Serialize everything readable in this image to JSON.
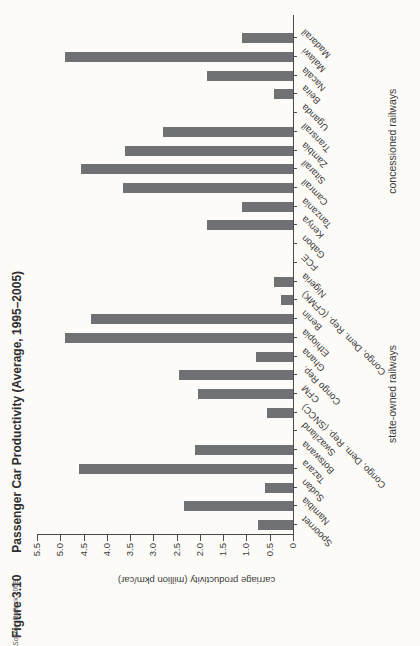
{
  "figure": {
    "label": "Figure 3.10",
    "title": "Passenger Car Productivity (Average, 1995–2005)"
  },
  "source": {
    "prefix": "Source:",
    "text": "Bullock 2009."
  },
  "chart_data": {
    "type": "bar",
    "title": "Passenger Car Productivity (Average, 1995–2005)",
    "figure_label": "Figure 3.10",
    "ylabel": "carriage productivity (million pkm/car)",
    "xlabel": "",
    "ylim": [
      0,
      5.5
    ],
    "ytick_labels": [
      "0",
      "0.5",
      "1.0",
      "1.5",
      "2.0",
      "2.5",
      "3.0",
      "3.5",
      "4.0",
      "4.5",
      "5.0",
      "5.5"
    ],
    "grid": false,
    "legend": false,
    "bar_color": "#707174",
    "layout_note": "figure printed rotated 90deg counterclockwise on portrait page; category labels angled 45deg; missing bars mean no data",
    "groups": [
      {
        "label": "state-owned railways",
        "categories": [
          "Spoornet",
          "Namibia",
          "Sudan",
          "Tazara",
          "Botswana",
          "Swaziland",
          "Congo, Dem. Rep. (SNCC)",
          "CFM",
          "Congo Rep.",
          "Ghana",
          "Ethiopia",
          "Benin",
          "Congo, Dem. Rep. (CFMK)",
          "Nigeria",
          "FCE"
        ],
        "values": [
          0.75,
          2.35,
          0.6,
          4.6,
          2.1,
          null,
          0.55,
          2.05,
          2.45,
          0.8,
          4.9,
          4.35,
          0.25,
          0.4,
          null
        ]
      },
      {
        "label": "concessioned railways",
        "categories": [
          "Gabon",
          "Kenya",
          "Tanzania",
          "Camrail",
          "Sitarail",
          "Zambia",
          "Transrail",
          "Uganda",
          "Beira",
          "Nacala",
          "Malawi",
          "Madarail"
        ],
        "values": [
          null,
          1.85,
          1.1,
          3.65,
          4.55,
          3.6,
          2.8,
          null,
          0.4,
          1.85,
          4.9,
          1.1
        ]
      }
    ]
  }
}
